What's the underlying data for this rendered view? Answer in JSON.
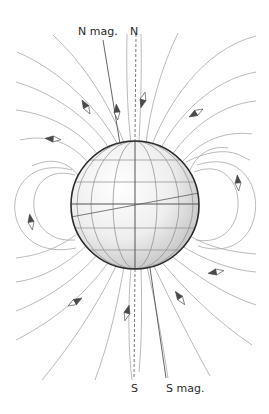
{
  "diagram": {
    "labels": {
      "n_mag": "N mag.",
      "n_geo": "N",
      "s_geo": "S",
      "s_mag": "S mag."
    },
    "colors": {
      "field_line": "#a8a8a8",
      "axis_line": "#555555",
      "sphere_outline": "#2b2b2b",
      "needle_dark": "#4a4a4a",
      "needle_light": "#ffffff",
      "background": "#ffffff"
    },
    "globe": {
      "cx": 135,
      "cy": 205,
      "r": 64
    },
    "compasses": [
      {
        "x": 86,
        "y": 107,
        "angle": 150
      },
      {
        "x": 117,
        "y": 112,
        "angle": 170
      },
      {
        "x": 143,
        "y": 97,
        "angle": 15
      },
      {
        "x": 196,
        "y": 113,
        "angle": 60
      },
      {
        "x": 53,
        "y": 138,
        "angle": 100
      },
      {
        "x": 31,
        "y": 222,
        "angle": 10
      },
      {
        "x": 238,
        "y": 183,
        "angle": 190
      },
      {
        "x": 216,
        "y": 272,
        "angle": 80
      },
      {
        "x": 76,
        "y": 302,
        "angle": 240
      },
      {
        "x": 128,
        "y": 313,
        "angle": 195
      },
      {
        "x": 180,
        "y": 297,
        "angle": 150
      }
    ]
  }
}
